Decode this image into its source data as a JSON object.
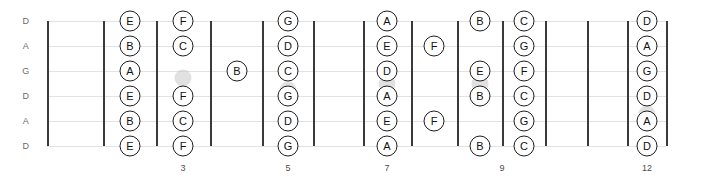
{
  "diagram": {
    "type": "guitar-fretboard",
    "tuning_name": "DADGAD",
    "width": 707,
    "height": 177,
    "colors": {
      "note_border": "#1d1d1d",
      "note_fill": "#ffffff",
      "note_text": "#111111",
      "fret_line": "#3a3a3a",
      "string_line": "#e2e2e2",
      "inlay_dot": "#c9c9c9",
      "string_label": "#6b6b6b",
      "fret_number": "#4d4d4d",
      "background": "#ffffff"
    },
    "strings": [
      {
        "index": 0,
        "label": "D",
        "y": 21
      },
      {
        "index": 1,
        "label": "A",
        "y": 46
      },
      {
        "index": 2,
        "label": "G",
        "y": 71
      },
      {
        "index": 3,
        "label": "D",
        "y": 96
      },
      {
        "index": 4,
        "label": "A",
        "y": 121
      },
      {
        "index": 5,
        "label": "D",
        "y": 146
      }
    ],
    "string_label_x": 26,
    "fret_lines": [
      {
        "fret": 0,
        "x": 47,
        "is_nut": true
      },
      {
        "fret": 1,
        "x": 103,
        "is_nut": false
      },
      {
        "fret": 2,
        "x": 156,
        "is_nut": false
      },
      {
        "fret": 3,
        "x": 210,
        "is_nut": false
      },
      {
        "fret": 4,
        "x": 262,
        "is_nut": false
      },
      {
        "fret": 5,
        "x": 313,
        "is_nut": false
      },
      {
        "fret": 6,
        "x": 363,
        "is_nut": false
      },
      {
        "fret": 7,
        "x": 411,
        "is_nut": false
      },
      {
        "fret": 8,
        "x": 457,
        "is_nut": false
      },
      {
        "fret": 9,
        "x": 502,
        "is_nut": false
      },
      {
        "fret": 10,
        "x": 545,
        "is_nut": false
      },
      {
        "fret": 11,
        "x": 587,
        "is_nut": false
      },
      {
        "fret": 12,
        "x": 627,
        "is_nut": false
      },
      {
        "fret": 13,
        "x": 666,
        "is_nut": false
      }
    ],
    "fret_numbers": [
      {
        "label": "3",
        "x": 183,
        "y": 163
      },
      {
        "label": "5",
        "x": 288,
        "y": 163
      },
      {
        "label": "7",
        "x": 387,
        "y": 163
      },
      {
        "label": "9",
        "x": 502,
        "y": 163
      },
      {
        "label": "12",
        "x": 647,
        "y": 163
      }
    ],
    "inlay_dots": [
      {
        "x": 183,
        "y": 78
      },
      {
        "x": 288,
        "y": 90
      },
      {
        "x": 387,
        "y": 84
      },
      {
        "x": 480,
        "y": 84
      },
      {
        "x": 647,
        "y": 114
      }
    ],
    "notes": [
      {
        "label": "E",
        "string": 0,
        "fret": 2,
        "x": 130,
        "y": 21
      },
      {
        "label": "B",
        "string": 1,
        "fret": 2,
        "x": 130,
        "y": 46
      },
      {
        "label": "A",
        "string": 2,
        "fret": 2,
        "x": 130,
        "y": 71
      },
      {
        "label": "E",
        "string": 3,
        "fret": 2,
        "x": 130,
        "y": 96
      },
      {
        "label": "B",
        "string": 4,
        "fret": 2,
        "x": 130,
        "y": 121
      },
      {
        "label": "E",
        "string": 5,
        "fret": 2,
        "x": 130,
        "y": 146
      },
      {
        "label": "F",
        "string": 0,
        "fret": 3,
        "x": 183,
        "y": 21
      },
      {
        "label": "C",
        "string": 1,
        "fret": 3,
        "x": 183,
        "y": 46
      },
      {
        "label": "F",
        "string": 3,
        "fret": 3,
        "x": 183,
        "y": 96
      },
      {
        "label": "C",
        "string": 4,
        "fret": 3,
        "x": 183,
        "y": 121
      },
      {
        "label": "F",
        "string": 5,
        "fret": 3,
        "x": 183,
        "y": 146
      },
      {
        "label": "B",
        "string": 2,
        "fret": 4,
        "x": 237,
        "y": 71
      },
      {
        "label": "G",
        "string": 0,
        "fret": 5,
        "x": 288,
        "y": 21
      },
      {
        "label": "D",
        "string": 1,
        "fret": 5,
        "x": 288,
        "y": 46
      },
      {
        "label": "C",
        "string": 2,
        "fret": 5,
        "x": 288,
        "y": 71
      },
      {
        "label": "G",
        "string": 3,
        "fret": 5,
        "x": 288,
        "y": 96
      },
      {
        "label": "D",
        "string": 4,
        "fret": 5,
        "x": 288,
        "y": 121
      },
      {
        "label": "G",
        "string": 5,
        "fret": 5,
        "x": 288,
        "y": 146
      },
      {
        "label": "A",
        "string": 0,
        "fret": 7,
        "x": 387,
        "y": 21
      },
      {
        "label": "E",
        "string": 1,
        "fret": 7,
        "x": 387,
        "y": 46
      },
      {
        "label": "D",
        "string": 2,
        "fret": 7,
        "x": 387,
        "y": 71
      },
      {
        "label": "A",
        "string": 3,
        "fret": 7,
        "x": 387,
        "y": 96
      },
      {
        "label": "E",
        "string": 4,
        "fret": 7,
        "x": 387,
        "y": 121
      },
      {
        "label": "A",
        "string": 5,
        "fret": 7,
        "x": 387,
        "y": 146
      },
      {
        "label": "F",
        "string": 1,
        "fret": 8,
        "x": 434,
        "y": 46
      },
      {
        "label": "F",
        "string": 4,
        "fret": 8,
        "x": 434,
        "y": 121
      },
      {
        "label": "B",
        "string": 0,
        "fret": 9,
        "x": 480,
        "y": 21
      },
      {
        "label": "E",
        "string": 2,
        "fret": 9,
        "x": 480,
        "y": 71
      },
      {
        "label": "B",
        "string": 3,
        "fret": 9,
        "x": 480,
        "y": 96
      },
      {
        "label": "B",
        "string": 5,
        "fret": 9,
        "x": 480,
        "y": 146
      },
      {
        "label": "C",
        "string": 0,
        "fret": 10,
        "x": 524,
        "y": 21
      },
      {
        "label": "G",
        "string": 1,
        "fret": 10,
        "x": 524,
        "y": 46
      },
      {
        "label": "F",
        "string": 2,
        "fret": 10,
        "x": 524,
        "y": 71
      },
      {
        "label": "C",
        "string": 3,
        "fret": 10,
        "x": 524,
        "y": 96
      },
      {
        "label": "G",
        "string": 4,
        "fret": 10,
        "x": 524,
        "y": 121
      },
      {
        "label": "C",
        "string": 5,
        "fret": 10,
        "x": 524,
        "y": 146
      },
      {
        "label": "D",
        "string": 0,
        "fret": 12,
        "x": 647,
        "y": 21
      },
      {
        "label": "A",
        "string": 1,
        "fret": 12,
        "x": 647,
        "y": 46
      },
      {
        "label": "G",
        "string": 2,
        "fret": 12,
        "x": 647,
        "y": 71
      },
      {
        "label": "D",
        "string": 3,
        "fret": 12,
        "x": 647,
        "y": 96
      },
      {
        "label": "A",
        "string": 4,
        "fret": 12,
        "x": 647,
        "y": 121
      },
      {
        "label": "D",
        "string": 5,
        "fret": 12,
        "x": 647,
        "y": 146
      }
    ]
  }
}
